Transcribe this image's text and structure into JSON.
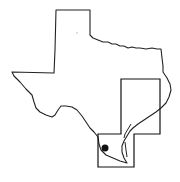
{
  "map": {
    "subject": "Texas state outline",
    "colors": {
      "background": "#ffffff",
      "outline": "#222222",
      "study_area": "#111111",
      "marker": "#111111",
      "faint_dot": "#b8b8b8"
    },
    "state_outline": "M56,10 L90,10 L90,35 L93,38 L98,40 L103,42 L108,42 L112,44 L116,44 L120,46 L124,46 L128,48 L132,47 L136,48 L140,48 L146,49 L152,48 L157,49 L161,49 L162,58 L163,66 L163,72 L167,78 L170,84 L171,90 L169,97 L166,103 L161,108 L156,112 L150,116 L144,120 L138,124 L133,128 L130,131 L127,136 L124,141 L122,146 L122,152 L124,158 L127,163 L120,161 L113,158 L106,155 L101,150 L99,144 L98,137 L94,132 L90,128 L86,122 L82,116 L77,110 L72,107 L66,106 L61,106 L58,110 L55,115 L52,117 L46,115 L40,112 L36,108 L34,102 L32,95 L26,89 L20,82 L14,76 L12,72 L54,73 L55,50 L56,10 Z",
    "study_area": "M121,79 L160,79 L160,134 L134,134 L134,167 L98,167 L98,134 L121,134 Z",
    "barrier_islands": "M131,124 L128,129 L125,134 L124,138 M125,142 L126,150 L127,157",
    "marker": {
      "label": "site-location",
      "cx": 105,
      "cy": 148,
      "r": 3.5
    },
    "faint_dot": {
      "cx": 77,
      "cy": 33,
      "r": 0.8
    }
  }
}
